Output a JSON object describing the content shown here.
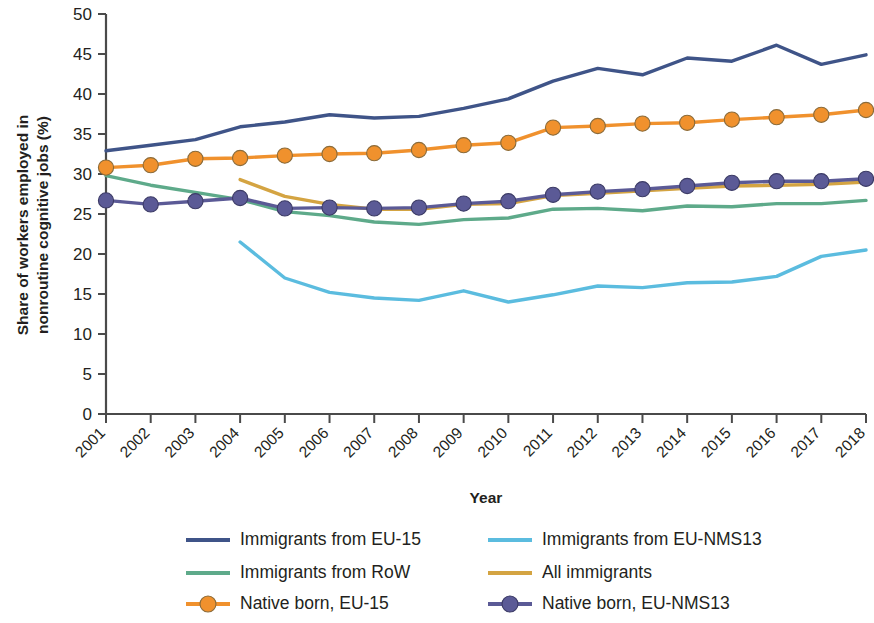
{
  "chart_data": {
    "type": "line",
    "title": "",
    "xlabel": "Year",
    "ylabel": "Share of workers employed in nonroutine cognitive jobs (%)",
    "categories": [
      2001,
      2002,
      2003,
      2004,
      2005,
      2006,
      2007,
      2008,
      2009,
      2010,
      2011,
      2012,
      2013,
      2014,
      2015,
      2016,
      2017,
      2018
    ],
    "x": [
      "2001",
      "2002",
      "2003",
      "2004",
      "2005",
      "2006",
      "2007",
      "2008",
      "2009",
      "2010",
      "2011",
      "2012",
      "2013",
      "2014",
      "2015",
      "2016",
      "2017",
      "2018"
    ],
    "xlim": [
      2001,
      2018
    ],
    "ylim": [
      0,
      50
    ],
    "yticks": [
      0,
      5,
      10,
      15,
      20,
      25,
      30,
      35,
      40,
      45,
      50
    ],
    "ytick_labels": [
      "0",
      "5",
      "10",
      "15",
      "20",
      "25",
      "30",
      "35",
      "40",
      "45",
      "50"
    ],
    "grid": false,
    "legend_position": "bottom",
    "legend_columns": 2,
    "series": [
      {
        "name": "Immigrants from EU-15",
        "color": "#3f5488",
        "marker": "none",
        "values": [
          32.9,
          33.6,
          34.3,
          35.9,
          36.5,
          37.4,
          37.0,
          37.2,
          38.2,
          39.4,
          41.6,
          43.2,
          42.4,
          44.5,
          44.1,
          46.1,
          43.7,
          44.9
        ]
      },
      {
        "name": "Immigrants from EU-NMS13",
        "color": "#5bbcdf",
        "marker": "none",
        "values": [
          null,
          null,
          null,
          21.5,
          17.0,
          15.2,
          14.5,
          14.2,
          15.4,
          14.0,
          14.9,
          16.0,
          15.8,
          16.4,
          16.5,
          17.2,
          19.7,
          20.5
        ]
      },
      {
        "name": "Immigrants from RoW",
        "color": "#5eaa8a",
        "marker": "none",
        "values": [
          29.8,
          28.6,
          27.7,
          26.8,
          25.3,
          24.8,
          24.0,
          23.7,
          24.3,
          24.5,
          25.6,
          25.7,
          25.4,
          26.0,
          25.9,
          26.3,
          26.3,
          26.7
        ]
      },
      {
        "name": "All immigrants",
        "color": "#d4a442",
        "marker": "none",
        "values": [
          null,
          null,
          null,
          29.3,
          27.2,
          26.2,
          25.6,
          25.6,
          26.2,
          26.3,
          27.3,
          27.6,
          27.9,
          28.2,
          28.5,
          28.6,
          28.7,
          29.0
        ]
      },
      {
        "name": "Native born, EU-15",
        "color": "#f0912d",
        "marker": "circle",
        "values": [
          30.8,
          31.1,
          31.9,
          32.0,
          32.3,
          32.5,
          32.6,
          33.0,
          33.6,
          33.9,
          35.8,
          36.0,
          36.3,
          36.4,
          36.8,
          37.1,
          37.4,
          38.0
        ]
      },
      {
        "name": "Native born, EU-NMS13",
        "color": "#5b5a96",
        "marker": "circle",
        "values": [
          26.7,
          26.2,
          26.6,
          27.0,
          25.7,
          25.8,
          25.7,
          25.8,
          26.3,
          26.6,
          27.4,
          27.8,
          28.1,
          28.5,
          28.9,
          29.1,
          29.1,
          29.4
        ]
      }
    ]
  }
}
